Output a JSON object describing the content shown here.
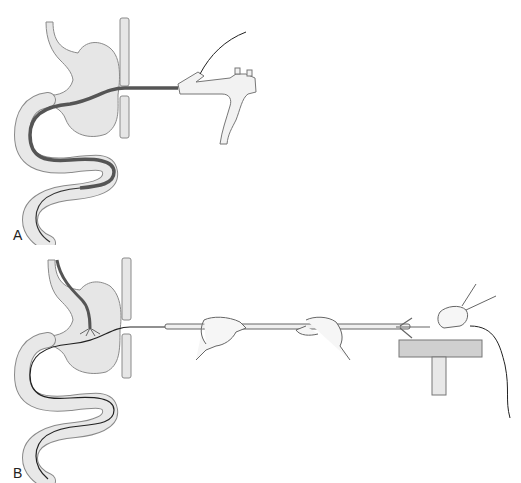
{
  "figure": {
    "panels": [
      {
        "label": "A",
        "description": "Endoscope advanced through esophagus and stomach into the jejunum via a push enteroscope",
        "elements": [
          "esophagus",
          "stomach",
          "diaphragm",
          "small-intestine",
          "enteroscope-shaft",
          "enteroscope-control-handle",
          "cable"
        ]
      },
      {
        "label": "B",
        "description": "Enteroscope withdrawn over a tube while hands pull the overtube; distal end held on a table",
        "elements": [
          "esophagus",
          "stomach",
          "diaphragm",
          "small-intestine",
          "guide-wire",
          "overtube",
          "left-hand",
          "right-hand",
          "far-hand",
          "support-table",
          "cable"
        ]
      }
    ],
    "colors": {
      "organ_fill": "#e6e6e6",
      "organ_outline": "#8a8a8a",
      "scope_dark": "#555555",
      "line": "#222222",
      "table_fill": "#d0d0d0"
    }
  }
}
